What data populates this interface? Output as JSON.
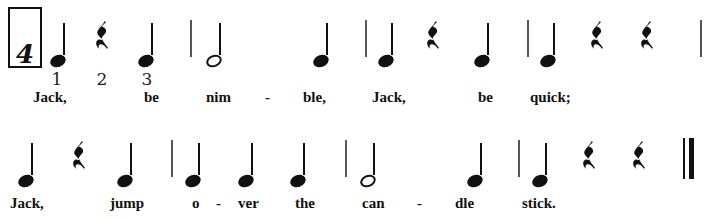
{
  "document": {
    "kind": "music-notation",
    "title": "Jack Be Nimble",
    "clef": "none",
    "time_signature_visible": "4",
    "background_color": "#ffffff",
    "ink_color": "#111111"
  },
  "time_signature": {
    "value": "4",
    "boxed": true,
    "box": {
      "x": 8,
      "y": 7,
      "w": 34,
      "h": 61
    }
  },
  "beat_numbers": [
    {
      "label": "1",
      "x": 45,
      "y": 69
    },
    {
      "label": "2",
      "x": 90,
      "y": 69
    },
    {
      "label": "3",
      "x": 135,
      "y": 69
    }
  ],
  "systems": [
    {
      "index": 1,
      "top": 0,
      "elements": [
        {
          "type": "note",
          "duration": "quarter",
          "x": 50,
          "y": 23,
          "stem_height": 32
        },
        {
          "type": "rest",
          "duration": "quarter",
          "x": 93,
          "y": 20
        },
        {
          "type": "note",
          "duration": "quarter",
          "x": 138,
          "y": 23,
          "stem_height": 32
        },
        {
          "type": "barline",
          "x": 190,
          "y": 20,
          "height": 37
        },
        {
          "type": "note",
          "duration": "half",
          "x": 206,
          "y": 23,
          "stem_height": 32
        },
        {
          "type": "note",
          "duration": "quarter",
          "x": 313,
          "y": 23,
          "stem_height": 32
        },
        {
          "type": "barline",
          "x": 365,
          "y": 20,
          "height": 37
        },
        {
          "type": "note",
          "duration": "quarter",
          "x": 378,
          "y": 23,
          "stem_height": 32
        },
        {
          "type": "rest",
          "duration": "quarter",
          "x": 424,
          "y": 20
        },
        {
          "type": "note",
          "duration": "quarter",
          "x": 474,
          "y": 23,
          "stem_height": 32
        },
        {
          "type": "barline",
          "x": 527,
          "y": 20,
          "height": 37
        },
        {
          "type": "note",
          "duration": "quarter",
          "x": 540,
          "y": 23,
          "stem_height": 32
        },
        {
          "type": "rest",
          "duration": "quarter",
          "x": 588,
          "y": 20
        },
        {
          "type": "rest",
          "duration": "quarter",
          "x": 638,
          "y": 20
        },
        {
          "type": "barline",
          "x": 700,
          "y": 20,
          "height": 37
        }
      ],
      "lyrics": [
        {
          "text": "Jack,",
          "x": 33,
          "y": 89
        },
        {
          "text": "be",
          "x": 144,
          "y": 89
        },
        {
          "text": "nim",
          "x": 206,
          "y": 89
        },
        {
          "text": "-",
          "x": 265,
          "y": 89,
          "is_hyphen": true
        },
        {
          "text": "ble,",
          "x": 303,
          "y": 89
        },
        {
          "text": "Jack,",
          "x": 372,
          "y": 89
        },
        {
          "text": "be",
          "x": 478,
          "y": 89
        },
        {
          "text": "quick;",
          "x": 530,
          "y": 89
        }
      ]
    },
    {
      "index": 2,
      "top": 120,
      "elements": [
        {
          "type": "note",
          "duration": "quarter",
          "x": 18,
          "y": 23,
          "stem_height": 32
        },
        {
          "type": "rest",
          "duration": "quarter",
          "x": 70,
          "y": 20
        },
        {
          "type": "note",
          "duration": "quarter",
          "x": 117,
          "y": 23,
          "stem_height": 32
        },
        {
          "type": "barline",
          "x": 171,
          "y": 20,
          "height": 37
        },
        {
          "type": "note",
          "duration": "quarter",
          "x": 185,
          "y": 23,
          "stem_height": 32
        },
        {
          "type": "note",
          "duration": "quarter",
          "x": 238,
          "y": 23,
          "stem_height": 32
        },
        {
          "type": "note",
          "duration": "quarter",
          "x": 290,
          "y": 23,
          "stem_height": 32
        },
        {
          "type": "barline",
          "x": 345,
          "y": 20,
          "height": 37
        },
        {
          "type": "note",
          "duration": "half",
          "x": 360,
          "y": 23,
          "stem_height": 32
        },
        {
          "type": "note",
          "duration": "quarter",
          "x": 467,
          "y": 23,
          "stem_height": 32
        },
        {
          "type": "barline",
          "x": 518,
          "y": 20,
          "height": 37
        },
        {
          "type": "note",
          "duration": "quarter",
          "x": 532,
          "y": 23,
          "stem_height": 32
        },
        {
          "type": "rest",
          "duration": "quarter",
          "x": 580,
          "y": 20
        },
        {
          "type": "rest",
          "duration": "quarter",
          "x": 630,
          "y": 20
        },
        {
          "type": "final-barline",
          "x": 683,
          "y": 18,
          "height": 41
        }
      ],
      "lyrics": [
        {
          "text": "Jack,",
          "x": 10,
          "y": 75
        },
        {
          "text": "jump",
          "x": 110,
          "y": 75
        },
        {
          "text": "o",
          "x": 192,
          "y": 75
        },
        {
          "text": "-",
          "x": 216,
          "y": 75,
          "is_hyphen": true
        },
        {
          "text": "ver",
          "x": 238,
          "y": 75
        },
        {
          "text": "the",
          "x": 295,
          "y": 75
        },
        {
          "text": "can",
          "x": 362,
          "y": 75
        },
        {
          "text": "-",
          "x": 417,
          "y": 75,
          "is_hyphen": true
        },
        {
          "text": "dle",
          "x": 455,
          "y": 75
        },
        {
          "text": "stick.",
          "x": 522,
          "y": 75
        }
      ]
    }
  ],
  "lyrics_full": "Jack, be nim-ble, Jack, be quick; Jack, jump o-ver the can-dle stick."
}
